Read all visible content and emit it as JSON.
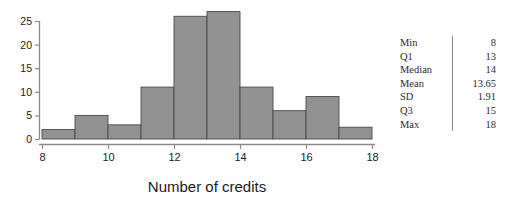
{
  "chart_data": {
    "type": "bar",
    "title": "",
    "subtitle": "",
    "xlabel": "Number of credits",
    "ylabel": "",
    "xlim": [
      8,
      18
    ],
    "ylim": [
      0,
      27.5
    ],
    "grid": false,
    "legend": null,
    "bin_width": 1,
    "bin_edges": [
      8,
      9,
      10,
      11,
      12,
      13,
      14,
      15,
      16,
      17,
      18
    ],
    "categories": [
      "8-9",
      "9-10",
      "10-11",
      "11-12",
      "12-13",
      "13-14",
      "14-15",
      "15-16",
      "16-17",
      "17-18"
    ],
    "values": [
      2,
      5,
      3,
      11,
      26,
      27,
      11,
      6,
      9,
      2.5
    ],
    "xticks": [
      8,
      10,
      12,
      14,
      16,
      18
    ],
    "xtick_labels": [
      "8",
      "10",
      "12",
      "14",
      "16",
      "18"
    ],
    "yticks": [
      0,
      5,
      10,
      15,
      20,
      25
    ],
    "ytick_labels": [
      "0",
      "5",
      "10",
      "15",
      "20",
      "25"
    ],
    "bar_color": "#929292",
    "bar_edge_color": "#4a4a4a",
    "axis_color": "#8a8a8a"
  },
  "stats": {
    "rows": [
      {
        "label": "Min",
        "value": "8"
      },
      {
        "label": "Q1",
        "value": "13"
      },
      {
        "label": "Median",
        "value": "14"
      },
      {
        "label": "Mean",
        "value": "13.65"
      },
      {
        "label": "SD",
        "value": "1.91"
      },
      {
        "label": "Q3",
        "value": "15"
      },
      {
        "label": "Max",
        "value": "18"
      }
    ]
  }
}
